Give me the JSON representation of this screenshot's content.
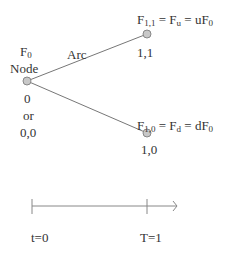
{
  "tree": {
    "root": {
      "value_label": "F",
      "value_sub": "0",
      "name_label": "Node",
      "index_label": "0",
      "or_label": "or",
      "coord_label": "0,0"
    },
    "arc_label": "Arc",
    "up_node": {
      "formula_a": "F",
      "formula_a_sub": "1,1",
      "eq1": " = F",
      "formula_b_sub": "u",
      "eq2": " = uF",
      "formula_c_sub": "0",
      "coord_label": "1,1"
    },
    "down_node": {
      "formula_a": "F",
      "formula_a_sub": "1,0",
      "eq1": " = F",
      "formula_b_sub": "d",
      "eq2": " = dF",
      "formula_c_sub": "0",
      "coord_label": "1,0"
    }
  },
  "timeline": {
    "start_label": "t=0",
    "end_label": "T=1"
  },
  "colors": {
    "node_fill": "#c8c8c8",
    "node_stroke": "#888888",
    "line": "#777777"
  }
}
